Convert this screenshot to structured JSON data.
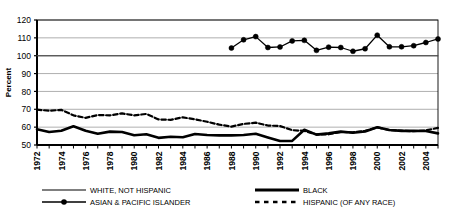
{
  "chart_data": {
    "type": "line",
    "title": "",
    "xlabel": "",
    "ylabel": "Percent",
    "ylim": [
      50,
      120
    ],
    "ytick_step": 10,
    "yticks": [
      50,
      60,
      70,
      80,
      90,
      100,
      110,
      120
    ],
    "grid": true,
    "legend_position": "bottom",
    "x": [
      1972,
      1973,
      1974,
      1975,
      1976,
      1977,
      1978,
      1979,
      1980,
      1981,
      1982,
      1983,
      1984,
      1985,
      1986,
      1987,
      1988,
      1989,
      1990,
      1991,
      1992,
      1993,
      1994,
      1995,
      1996,
      1997,
      1998,
      1999,
      2000,
      2001,
      2002,
      2003,
      2004,
      2005
    ],
    "xtick_labels": [
      "1972",
      "1974",
      "1976",
      "1978",
      "1980",
      "1982",
      "1984",
      "1986",
      "1988",
      "1990",
      "1992",
      "1994",
      "1996",
      "1998",
      "2000",
      "2002",
      "2004"
    ],
    "xlim": [
      1972,
      2005
    ],
    "series": [
      {
        "name": "WHITE, NOT HISPANIC",
        "style": "thin-solid",
        "color": "#555555",
        "values": [
          100,
          100,
          100,
          100,
          100,
          100,
          100,
          100,
          100,
          100,
          100,
          100,
          100,
          100,
          100,
          100,
          100,
          100,
          100,
          100,
          100,
          100,
          100,
          100,
          100,
          100,
          100,
          100,
          100,
          100,
          100,
          100,
          100,
          100
        ]
      },
      {
        "name": "BLACK",
        "style": "thick-solid",
        "color": "#000000",
        "values": [
          58.8,
          57.3,
          58.0,
          60.5,
          58.0,
          56.3,
          57.5,
          57.3,
          55.5,
          56.0,
          54.0,
          54.6,
          54.3,
          56.2,
          55.6,
          55.4,
          55.4,
          55.6,
          56.3,
          54.2,
          52.2,
          52.3,
          58.5,
          55.8,
          56.5,
          57.5,
          56.9,
          57.6,
          59.9,
          58.4,
          57.9,
          58.0,
          57.8,
          56.5
        ]
      },
      {
        "name": "ASIAN & PACIFIC ISLANDER",
        "style": "marker-solid",
        "color": "#000000",
        "start_year": 1988,
        "values": [
          null,
          null,
          null,
          null,
          null,
          null,
          null,
          null,
          null,
          null,
          null,
          null,
          null,
          null,
          null,
          null,
          104.3,
          108.9,
          110.7,
          104.6,
          104.9,
          108.3,
          108.6,
          103.0,
          104.8,
          104.6,
          102.5,
          103.9,
          111.5,
          105.0,
          105.0,
          105.6,
          107.4,
          109.4
        ]
      },
      {
        "name": "HISPANIC (OF ANY RACE)",
        "style": "dashed",
        "color": "#000000",
        "values": [
          69.8,
          69.2,
          69.7,
          66.6,
          65.2,
          66.8,
          66.6,
          67.7,
          66.6,
          67.4,
          64.3,
          64.1,
          65.5,
          64.4,
          63.0,
          61.4,
          60.3,
          61.8,
          62.5,
          60.9,
          60.6,
          58.3,
          57.9,
          55.9,
          56.0,
          57.3,
          57.1,
          57.9,
          59.9,
          58.3,
          58.0,
          57.7,
          58.2,
          59.6
        ]
      }
    ]
  },
  "legend": {
    "items": [
      {
        "label": "WHITE, NOT HISPANIC",
        "style": "thin-solid"
      },
      {
        "label": "BLACK",
        "style": "thick-solid"
      },
      {
        "label": "ASIAN & PACIFIC ISLANDER",
        "style": "marker-solid"
      },
      {
        "label": "HISPANIC (OF ANY RACE)",
        "style": "dashed"
      }
    ]
  },
  "axis": {
    "y_title": "Percent"
  }
}
